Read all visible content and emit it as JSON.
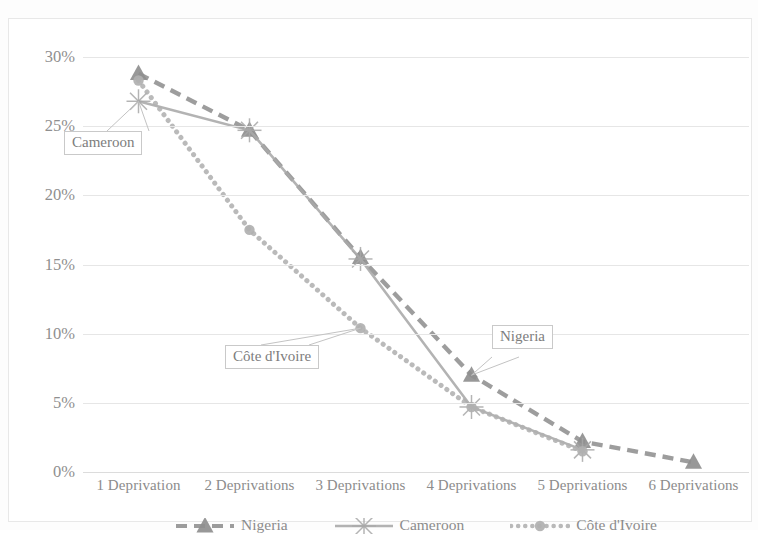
{
  "chart_data": {
    "type": "line",
    "title": "",
    "xlabel": "",
    "ylabel": "",
    "categories": [
      "1 Deprivation",
      "2 Deprivations",
      "3 Deprivations",
      "4 Deprivations",
      "5 Deprivations",
      "6 Deprivations"
    ],
    "ylim": [
      0,
      30
    ],
    "ytick_labels": [
      "0%",
      "5%",
      "10%",
      "15%",
      "20%",
      "25%",
      "30%"
    ],
    "ytick_values": [
      0,
      5,
      10,
      15,
      20,
      25,
      30
    ],
    "grid": true,
    "legend_position": "bottom",
    "series": [
      {
        "name": "Nigeria",
        "values": [
          28.8,
          24.7,
          15.5,
          7.0,
          2.2,
          0.7
        ],
        "color": "#8f8f8f",
        "line_style": "dashed",
        "marker": "triangle"
      },
      {
        "name": "Cameroon",
        "values": [
          26.8,
          24.7,
          15.4,
          4.7,
          1.6,
          null
        ],
        "color": "#a8a8a8",
        "line_style": "solid",
        "marker": "star"
      },
      {
        "name": "Côte d'Ivoire",
        "values": [
          28.3,
          17.5,
          10.4,
          4.7,
          1.5,
          null
        ],
        "color": "#b0b0b0",
        "line_style": "dotted",
        "marker": "circle"
      }
    ],
    "annotations": [
      {
        "label": "Cameroon",
        "points_to_series": "Cameroon",
        "points_to_category": "1 Deprivation"
      },
      {
        "label": "Côte d'Ivoire",
        "points_to_series": "Côte d'Ivoire",
        "points_to_category": "3 Deprivations"
      },
      {
        "label": "Nigeria",
        "points_to_series": "Nigeria",
        "points_to_category": "4 Deprivations"
      }
    ]
  },
  "axis": {
    "y_labels": [
      "30%",
      "25%",
      "20%",
      "15%",
      "10%",
      "5%",
      "0%"
    ],
    "x_labels": [
      "1 Deprivation",
      "2 Deprivations",
      "3 Deprivations",
      "4 Deprivations",
      "5 Deprivations",
      "6 Deprivations"
    ]
  },
  "legend": {
    "items": [
      {
        "label": "Nigeria"
      },
      {
        "label": "Cameroon"
      },
      {
        "label": "Côte d'Ivoire"
      }
    ]
  },
  "callouts": {
    "cameroon": "Cameroon",
    "cote_divoire": "Côte d'Ivoire",
    "nigeria": "Nigeria"
  },
  "colors": {
    "nigeria": "#8f8f8f",
    "cameroon": "#a8a8a8",
    "cote_divoire": "#b0b0b0",
    "grid": "#e6e6e6",
    "text": "#8c8c8c"
  }
}
